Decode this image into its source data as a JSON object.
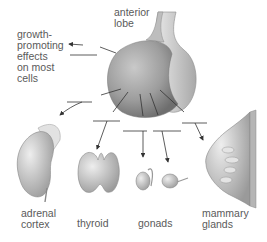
{
  "diagram": {
    "source_label": "anterior\nlobe",
    "targets": [
      {
        "id": "growth",
        "label": "growth-\npromoting\neffects\non most\ncells"
      },
      {
        "id": "adrenal",
        "label": "adrenal\ncortex"
      },
      {
        "id": "thyroid",
        "label": "thyroid"
      },
      {
        "id": "gonads",
        "label": "gonads"
      },
      {
        "id": "mammary",
        "label": "mammary\nglands"
      }
    ]
  },
  "colors": {
    "line": "#333333",
    "organ_fill": "#c8c8c8",
    "label": "#5a5a5a"
  }
}
